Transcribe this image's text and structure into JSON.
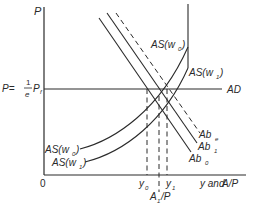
{
  "diagram": {
    "type": "economics AS-AD diagram",
    "axes": {
      "y_label": "P",
      "x_label_prefix": "y and ",
      "x_label_suffix": "A/P",
      "origin_label": "0"
    },
    "price_level_label": {
      "lhs": "P=",
      "numerator": "1",
      "denominator": "e",
      "rhs": "P",
      "rhs_sub": "f"
    },
    "curves": {
      "ad": "AD",
      "as_w0": {
        "base": "AS(w",
        "sub": "0",
        "close": ")"
      },
      "as_w1": {
        "base": "AS(w",
        "sub": "1",
        "close": ")"
      },
      "ab_e": {
        "base": "Ab",
        "sub": "e"
      },
      "ab_1": {
        "base": "Ab",
        "sub": "1"
      },
      "ab_0": {
        "base": "Ab",
        "sub": "0"
      }
    },
    "x_ticks": {
      "y0": {
        "base": "y",
        "sub": "0"
      },
      "y1": {
        "base": "y",
        "sub": "1"
      },
      "a1p": {
        "base": "A",
        "sub": "1",
        "rest": "/P"
      }
    },
    "colors": {
      "ink": "#2a2a2a",
      "background": "#ffffff"
    }
  }
}
